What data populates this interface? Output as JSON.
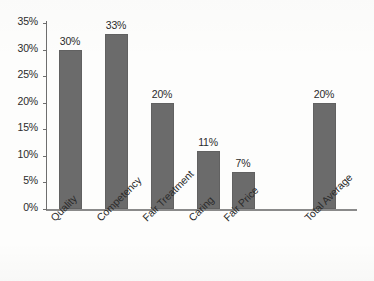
{
  "chart_data": {
    "type": "bar",
    "title": "",
    "subtitle": "",
    "xlabel": "",
    "ylabel": "",
    "categories": [
      "Quality",
      "Competency",
      "Fair Treatment",
      "Caring",
      "Fair Price",
      "Total Average"
    ],
    "values": [
      30,
      33,
      20,
      11,
      7,
      20
    ],
    "data_labels": [
      "30%",
      "33%",
      "20%",
      "11%",
      "7%",
      "20%"
    ],
    "ylim": [
      0,
      35
    ],
    "y_ticks": [
      0,
      5,
      10,
      15,
      20,
      25,
      30,
      35
    ],
    "y_tick_labels": [
      "0%",
      "5%",
      "10%",
      "15%",
      "20%",
      "25%",
      "30%",
      "35%"
    ],
    "grid": false,
    "legend": false,
    "legend_position": "none",
    "bar_color": "#6b6b6b",
    "axis_color": "#6e6e6e",
    "text_color": "#2b2b2b",
    "background_color": "#fdfdfc",
    "category_label_rotation": -45
  }
}
